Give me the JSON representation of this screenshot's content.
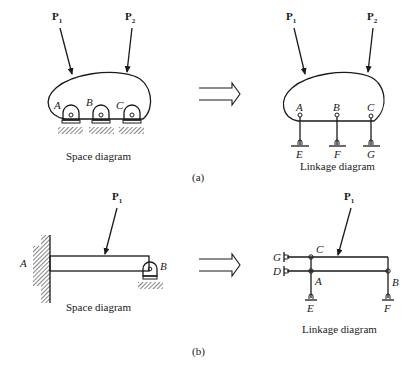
{
  "figure": {
    "part_a": {
      "tag": "(a)",
      "space_diagram": {
        "caption": "Space diagram",
        "loads": [
          {
            "name": "P",
            "sub": "1"
          },
          {
            "name": "P",
            "sub": "2"
          }
        ],
        "supports": [
          "A",
          "B",
          "C"
        ]
      },
      "linkage_diagram": {
        "caption": "Linkage diagram",
        "loads": [
          {
            "name": "P",
            "sub": "1"
          },
          {
            "name": "P",
            "sub": "2"
          }
        ],
        "joints": [
          "A",
          "B",
          "C"
        ],
        "grounds": [
          "E",
          "F",
          "G"
        ]
      }
    },
    "part_b": {
      "tag": "(b)",
      "space_diagram": {
        "caption": "Space diagram",
        "loads": [
          {
            "name": "P",
            "sub": "1"
          }
        ],
        "points": [
          "A",
          "B"
        ]
      },
      "linkage_diagram": {
        "caption": "Linkage diagram",
        "loads": [
          {
            "name": "P",
            "sub": "1"
          }
        ],
        "joints": [
          "C",
          "A",
          "B"
        ],
        "grounds": [
          "G",
          "D",
          "E",
          "F"
        ]
      }
    }
  }
}
